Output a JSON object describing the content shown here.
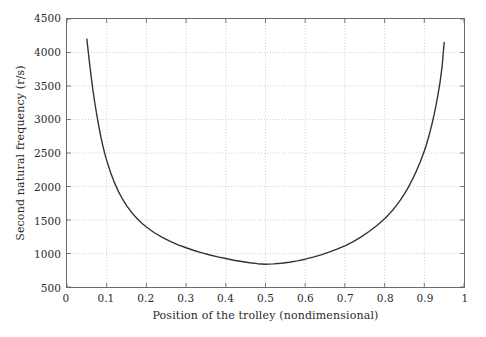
{
  "chart_data": {
    "type": "line",
    "title": "",
    "xlabel": "Position of the trolley (nondimensional)",
    "ylabel": "Second natural frequency (r/s)",
    "xlim": [
      0,
      1
    ],
    "ylim": [
      500,
      4500
    ],
    "xticks": [
      0,
      0.1,
      0.2,
      0.3,
      0.4,
      0.5,
      0.6,
      0.7,
      0.8,
      0.9,
      1
    ],
    "xtick_labels": [
      "0",
      "0.1",
      "0.2",
      "0.3",
      "0.4",
      "0.5",
      "0.6",
      "0.7",
      "0.8",
      "0.9",
      "1"
    ],
    "yticks": [
      500,
      1000,
      1500,
      2000,
      2500,
      3000,
      3500,
      4000,
      4500
    ],
    "ytick_labels": [
      "500",
      "1000",
      "1500",
      "2000",
      "2500",
      "3000",
      "3500",
      "4000",
      "4500"
    ],
    "grid": true,
    "grid_style": "dotted",
    "legend": null,
    "line_color": "#333333",
    "line_width": 1.4,
    "series": [
      {
        "name": "Second natural frequency",
        "x": [
          0.05,
          0.055,
          0.06,
          0.065,
          0.07,
          0.075,
          0.08,
          0.085,
          0.09,
          0.095,
          0.1,
          0.11,
          0.12,
          0.13,
          0.14,
          0.15,
          0.16,
          0.17,
          0.18,
          0.19,
          0.2,
          0.22,
          0.24,
          0.26,
          0.28,
          0.3,
          0.32,
          0.34,
          0.36,
          0.38,
          0.4,
          0.42,
          0.44,
          0.46,
          0.48,
          0.5,
          0.52,
          0.54,
          0.56,
          0.58,
          0.6,
          0.62,
          0.64,
          0.66,
          0.68,
          0.7,
          0.72,
          0.74,
          0.76,
          0.78,
          0.8,
          0.81,
          0.82,
          0.83,
          0.84,
          0.85,
          0.86,
          0.87,
          0.88,
          0.89,
          0.9,
          0.905,
          0.91,
          0.915,
          0.92,
          0.925,
          0.93,
          0.935,
          0.94,
          0.945,
          0.95
        ],
        "y": [
          4200,
          3930,
          3680,
          3450,
          3250,
          3070,
          2900,
          2750,
          2615,
          2495,
          2390,
          2205,
          2050,
          1920,
          1810,
          1715,
          1635,
          1562,
          1500,
          1444,
          1395,
          1310,
          1240,
          1180,
          1130,
          1086,
          1045,
          1010,
          978,
          950,
          925,
          900,
          880,
          862,
          848,
          840,
          845,
          855,
          870,
          890,
          915,
          945,
          980,
          1020,
          1065,
          1115,
          1175,
          1245,
          1325,
          1415,
          1520,
          1580,
          1645,
          1718,
          1800,
          1890,
          1990,
          2105,
          2230,
          2370,
          2530,
          2620,
          2720,
          2830,
          2950,
          3080,
          3225,
          3390,
          3570,
          3800,
          4150
        ]
      }
    ]
  },
  "axes": {
    "frame_color": "#6b6b6b",
    "grid_color": "#bfbfbf",
    "background": "#ffffff"
  }
}
